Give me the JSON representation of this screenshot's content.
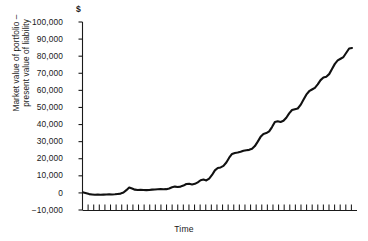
{
  "chart_data": {
    "type": "line",
    "title": "",
    "subtitle": "",
    "unit_symbol": "$",
    "xlabel": "Time",
    "ylabel_line1": "Market value of portfolio –",
    "ylabel_line2": "present value of liability",
    "ylim": [
      -10000,
      100000
    ],
    "ytick_labels": [
      "100,000",
      "90,000",
      "80,000",
      "70,000",
      "60,000",
      "50,000",
      "40,000",
      "30,000",
      "20,000",
      "10,000",
      "0",
      "−10,000"
    ],
    "ytick_values": [
      100000,
      90000,
      80000,
      70000,
      60000,
      50000,
      40000,
      30000,
      20000,
      10000,
      0,
      -10000
    ],
    "xtick_labels": [],
    "xtick_count": 48,
    "grid": false,
    "legend": null,
    "legend_position": "none",
    "line_color": "#111111",
    "axis_color": "#1a1a1a",
    "background_color": "#ffffff",
    "x": [
      0,
      1,
      2,
      3,
      4,
      5,
      6,
      7,
      8,
      9,
      10,
      11,
      12,
      13,
      14,
      15,
      16,
      17,
      18,
      19,
      20,
      21,
      22,
      23,
      24,
      25,
      26,
      27,
      28,
      29,
      30,
      31,
      32,
      33,
      34,
      35,
      36,
      37,
      38,
      39,
      40,
      41,
      42,
      43,
      44,
      45,
      46,
      47,
      48,
      49,
      50,
      51,
      52,
      53,
      54,
      55,
      56,
      57,
      58,
      59,
      60,
      61,
      62,
      63,
      64,
      65,
      66,
      67,
      68,
      69,
      70,
      71,
      72,
      73,
      74,
      75,
      76,
      77,
      78,
      79,
      80,
      81,
      82,
      83,
      84,
      85,
      86,
      87,
      88,
      89,
      90,
      91,
      92,
      93,
      94
    ],
    "values": [
      300,
      -200,
      -700,
      -900,
      -1100,
      -1000,
      -1100,
      -1000,
      -900,
      -800,
      -900,
      -800,
      -600,
      -400,
      200,
      1600,
      3200,
      2600,
      1900,
      1700,
      1800,
      1700,
      1600,
      1700,
      1900,
      2000,
      2100,
      2200,
      2100,
      2200,
      2600,
      3300,
      3700,
      3500,
      3700,
      4300,
      5200,
      5300,
      4900,
      5300,
      6200,
      7400,
      7800,
      7300,
      8400,
      10500,
      13200,
      14600,
      14900,
      15800,
      17800,
      20600,
      22800,
      23400,
      23600,
      24100,
      24700,
      25000,
      25200,
      25800,
      27400,
      30000,
      32800,
      34500,
      35000,
      36000,
      38500,
      41500,
      41900,
      41500,
      42200,
      44000,
      46500,
      48500,
      49000,
      49400,
      51500,
      54500,
      57500,
      59500,
      60500,
      61500,
      63500,
      66000,
      67500,
      68000,
      69500,
      72500,
      75500,
      77500,
      78500,
      79500,
      82000,
      84500,
      84800
    ],
    "series_name": "surplus"
  }
}
